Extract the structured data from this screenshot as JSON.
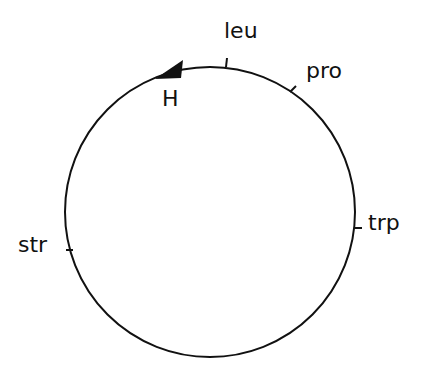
{
  "diagram": {
    "type": "circular genetic map",
    "markers": [
      {
        "label": "leu",
        "angle_deg": 6
      },
      {
        "label": "pro",
        "angle_deg": 36
      },
      {
        "label": "trp",
        "angle_deg": 94
      },
      {
        "label": "str",
        "angle_deg": 260
      }
    ],
    "origin": {
      "label": "H",
      "direction": "counterclockwise"
    },
    "colors": {
      "line": "#111111",
      "background": "#ffffff"
    }
  }
}
